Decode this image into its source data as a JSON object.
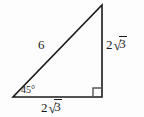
{
  "figure": {
    "background_color": "#fdfdfd",
    "stroke_color": "#1a1a1a",
    "watermark_text": "",
    "geometry": {
      "vertices": {
        "top": [
          102,
          5
        ],
        "bottom_left": [
          13,
          97
        ],
        "bottom_right": [
          102,
          97
        ]
      },
      "right_angle_marker": {
        "at": "bottom_right",
        "size": 9
      }
    },
    "labels": {
      "hypotenuse": "6",
      "vertical_leg_coefficient": "2",
      "vertical_leg_radicand": "3",
      "horizontal_leg_coefficient": "2",
      "horizontal_leg_radicand": "3",
      "radical_glyph": "√",
      "angle": "45°"
    }
  }
}
